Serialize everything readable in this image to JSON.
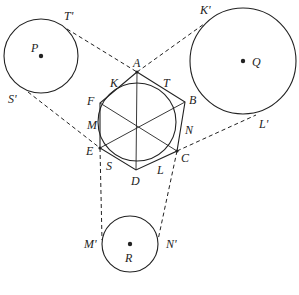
{
  "diagram": {
    "hexagon_vertices": [
      "A",
      "B",
      "C",
      "D",
      "E",
      "F"
    ],
    "inner_circle_tangent_points": [
      "K",
      "T",
      "N",
      "L",
      "S",
      "M"
    ],
    "circles": [
      {
        "center": "P",
        "tangent_points": [
          "T'",
          "S'"
        ]
      },
      {
        "center": "Q",
        "tangent_points": [
          "K'",
          "L'"
        ]
      },
      {
        "center": "R",
        "tangent_points": [
          "M'",
          "N'"
        ]
      }
    ],
    "labels": {
      "A": "A",
      "B": "B",
      "C": "C",
      "D": "D",
      "E": "E",
      "F": "F",
      "K": "K",
      "T": "T",
      "N": "N",
      "L": "L",
      "S": "S",
      "M": "M",
      "P": "P",
      "Q": "Q",
      "R": "R",
      "Tp": "T'",
      "Sp": "S'",
      "Kp": "K'",
      "Lp": "L'",
      "Mp": "M'",
      "Np": "N'"
    }
  }
}
